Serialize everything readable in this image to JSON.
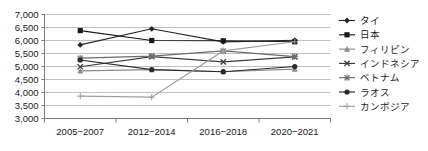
{
  "chart_data": {
    "type": "line",
    "title": "",
    "subtitle": "",
    "xlabel": "",
    "ylabel": "",
    "categories": [
      "2005−2007",
      "2012−2014",
      "2016−2018",
      "2020−2021"
    ],
    "ylim": [
      3000,
      7000
    ],
    "ytick_step": 500,
    "ytick_labels": [
      "7,000",
      "6,500",
      "6,000",
      "5,500",
      "5,000",
      "4,500",
      "4,000",
      "3,500",
      "3,000"
    ],
    "ytick_values": [
      7000,
      6500,
      6000,
      5500,
      5000,
      4500,
      4000,
      3500,
      3000
    ],
    "grid": true,
    "legend_position": "right",
    "series": [
      {
        "name": "タイ",
        "marker": "diamond",
        "color": "#262626",
        "values": [
          5830,
          6450,
          5950,
          6010
        ]
      },
      {
        "name": "日本",
        "marker": "square",
        "color": "#1a1a1a",
        "values": [
          6380,
          6000,
          5990,
          5950
        ]
      },
      {
        "name": "フィリピン",
        "marker": "triangle",
        "color": "#8a8a8a",
        "values": [
          4830,
          4880,
          4800,
          4900
        ]
      },
      {
        "name": "インドネシア",
        "marker": "cross-x",
        "color": "#3d3d3d",
        "values": [
          4990,
          5380,
          5180,
          5370
        ]
      },
      {
        "name": "ベトナム",
        "marker": "asterisk",
        "color": "#6b6b6b",
        "values": [
          5320,
          5400,
          5600,
          5380
        ]
      },
      {
        "name": "ラオス",
        "marker": "circle",
        "color": "#2b2b2b",
        "values": [
          5250,
          4880,
          4800,
          5000
        ]
      },
      {
        "name": "カンボジア",
        "marker": "plus",
        "color": "#9e9e9e",
        "values": [
          3860,
          3820,
          5600,
          5950
        ]
      }
    ]
  }
}
